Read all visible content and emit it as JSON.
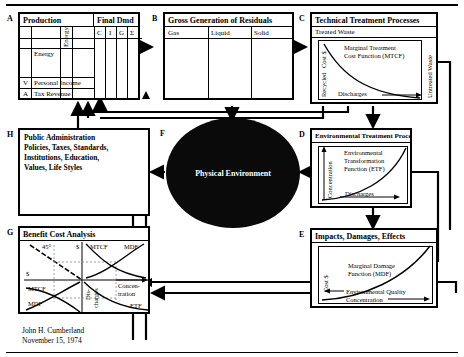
{
  "diagram": {
    "author": "John H. Cumberland",
    "date": "November 15, 1974"
  },
  "center": {
    "label": "F",
    "text": "Physical Environment"
  },
  "boxes": {
    "a": {
      "label": "A",
      "header_left": "Production",
      "header_right": "Final Dmd",
      "vertical_col": "Energy",
      "final_demand_cols": [
        "C",
        "I",
        "G",
        "Σ"
      ],
      "row_energy": "Energy",
      "row_v_code": "V",
      "row_v_text": "Personal Income",
      "row_a_code": "A",
      "row_a_text": "Tax Revenue"
    },
    "b": {
      "label": "B",
      "header": "Gross Generation of Residuals",
      "columns": [
        "Gas",
        "Liquid",
        "Solid"
      ]
    },
    "c": {
      "label": "C",
      "header": "Technical Treatment Processes",
      "subheader": "Treated Waste",
      "yaxis_top": "Cost $",
      "yaxis_bottom": "Recycled",
      "xaxis": "Discharges",
      "curve_label_1": "Marginal Treatment",
      "curve_label_2": "Cost Function (MTCF)",
      "right_axis": "Untreated Waste"
    },
    "d": {
      "label": "D",
      "header": "Environmental Treatment Processes",
      "yaxis": "Concentration",
      "xaxis": "Discharges",
      "curve_label_1": "Environmental",
      "curve_label_2": "Transformation",
      "curve_label_3": "Function (ETF)"
    },
    "e": {
      "label": "E",
      "header": "Impacts, Damages, Effects",
      "yaxis": "Cost $",
      "xaxis_1": "Environmental Quality",
      "xaxis_2": "Concentration",
      "curve_label_1": "Marginal Damage",
      "curve_label_2": "Function (MDF)"
    },
    "g": {
      "label": "G",
      "header": "Benefit Cost Analysis",
      "q2_angle": "45°",
      "q1_dollar": "$",
      "q1_mtcf": "MTCF",
      "q1_mdf": "MDF",
      "q3_dollar": "$",
      "q3_mtcf": "MTCF",
      "q3_mdf": "MDF",
      "q4_conc_1": "Concen-",
      "q4_conc_2": "tration",
      "q4_etf": "ETF",
      "axis_dis_1": "Dis-",
      "axis_dis_2": "charges"
    },
    "h": {
      "label": "H",
      "line1": "Public Administration",
      "line2": "Policies, Taxes, Standards,",
      "line3": "Institutions, Education,",
      "line4": "Values, Life Styles"
    }
  }
}
